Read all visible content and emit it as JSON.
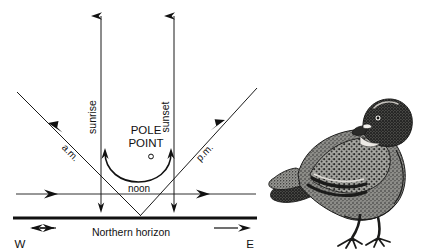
{
  "figure": {
    "name": "sun-compass-diagram",
    "type": "diagram",
    "colors": {
      "ink": "#111111",
      "line": "#1a1a1a",
      "background": "#ffffff"
    }
  },
  "labels": {
    "sunrise": "sunrise",
    "sunset": "sunset",
    "pole_point_line1": "POLE",
    "pole_point_line2": "POINT",
    "am": "a.m.",
    "pm": "p.m.",
    "noon": "noon",
    "horizon": "Northern horizon",
    "west": "W",
    "east": "E"
  },
  "illustration": {
    "subject": "pigeon",
    "caption": ""
  },
  "diagram_geometry": {
    "sunrise_line_x": 101,
    "sunset_line_x": 174,
    "horizontal_ray_y": 194,
    "horizon_y": 218,
    "vertex_x": 139,
    "pole_point_marker": {
      "x": 150,
      "y": 155
    }
  }
}
